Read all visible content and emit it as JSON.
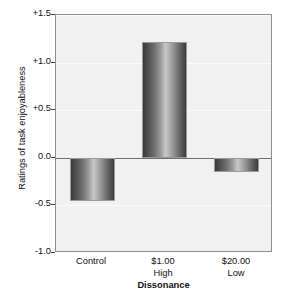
{
  "chart_data": {
    "type": "bar",
    "title": "",
    "xlabel": "Dissonance",
    "ylabel": "Ratings of task enjoyableness",
    "categories": [
      "Control",
      "$1.00",
      "$20.00"
    ],
    "category_sublabels": [
      "",
      "High",
      "Low"
    ],
    "values": [
      -0.45,
      1.22,
      -0.15
    ],
    "ylim": [
      -1.0,
      1.5
    ],
    "yticks": [
      1.5,
      1.0,
      0.5,
      0.0,
      -0.5,
      -1.0
    ],
    "ytick_labels": [
      "+1.5",
      "+1.0",
      "+0.5",
      "0.0",
      "-0.5",
      "-1.0"
    ],
    "grid": true,
    "legend": null,
    "series": [
      {
        "name": "Ratings of task enjoyableness",
        "values": [
          -0.45,
          1.22,
          -0.15
        ]
      }
    ],
    "colors": {
      "plot_background": "#f1f1f1",
      "frame": "#8e8e8e",
      "gridline": "#fbfbfb",
      "zeroline": "#6f6f6f",
      "bar_dark": "#3a3a3a",
      "bar_light": "#c9c9c9",
      "text": "#111111"
    }
  }
}
